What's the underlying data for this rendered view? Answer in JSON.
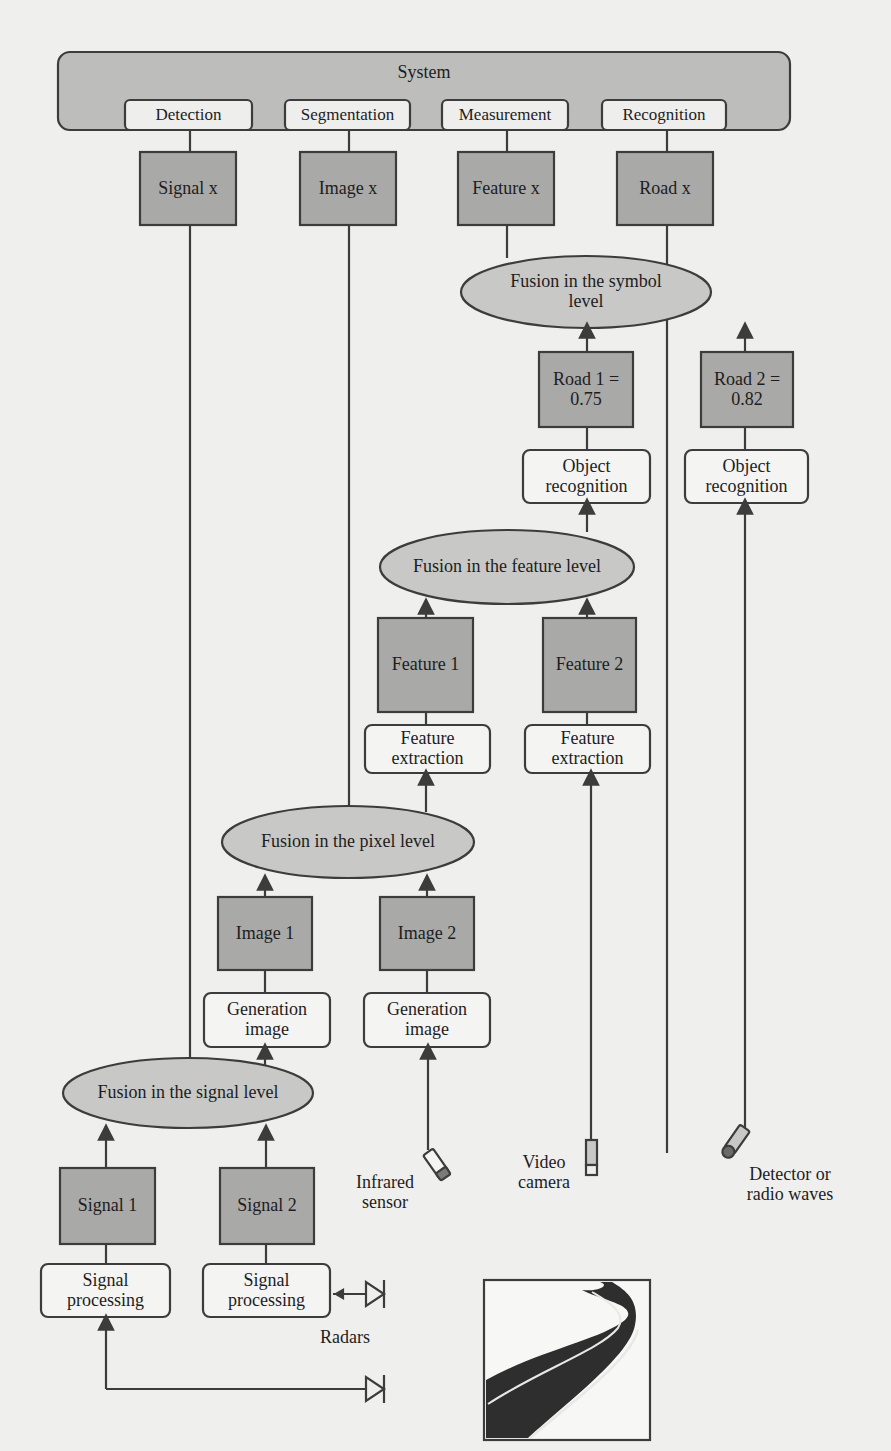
{
  "figure": {
    "system": {
      "label": "System",
      "tasks": [
        "Detection",
        "Segmentation",
        "Measurement",
        "Recognition"
      ]
    },
    "outputs": [
      "Signal x",
      "Image x",
      "Feature x",
      "Road x"
    ],
    "fusion_levels": {
      "symbol": "Fusion in the symbol level",
      "feature": "Fusion in the feature level",
      "pixel": "Fusion in the pixel level",
      "signal": "Fusion in the signal level"
    },
    "symbol_inputs": [
      {
        "value": "Road 1 = 0.75",
        "process": "Object recognition"
      },
      {
        "value": "Road 2 = 0.82",
        "process": "Object recognition"
      }
    ],
    "feature_inputs": [
      {
        "value": "Feature 1",
        "process": "Feature extraction"
      },
      {
        "value": "Feature 2",
        "process": "Feature extraction"
      }
    ],
    "pixel_inputs": [
      {
        "value": "Image 1",
        "process": "Generation image"
      },
      {
        "value": "Image 2",
        "process": "Generation image"
      }
    ],
    "signal_inputs": [
      {
        "value": "Signal 1",
        "process": "Signal processing"
      },
      {
        "value": "Signal 2",
        "process": "Signal processing"
      }
    ],
    "sensors": {
      "infrared": "Infrared sensor",
      "video": "Video camera",
      "detector": "Detector or radio waves",
      "radars": "Radars"
    },
    "colors": {
      "box_fill_dark": "#a9a9a7",
      "ellipse_fill": "#c8c8c6",
      "system_fill": "#bdbdbb",
      "light_box_fill": "#f4f4f2",
      "stroke": "#3c3c3c",
      "road": "#2e2e2e"
    }
  }
}
